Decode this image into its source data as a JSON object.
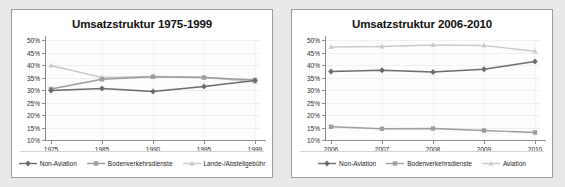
{
  "page": {
    "background_color": "#e8e8e8",
    "panel_background_color": "#ffffff",
    "panel_border_color": "#9a9a9a"
  },
  "colors": {
    "non_aviation": "#6b6b6b",
    "bodenverkehrsdienste": "#9d9d9d",
    "lande_abstellgebuehr": "#c9c9c9",
    "aviation": "#c9c9c9",
    "axis": "#8d8d8d",
    "grid": "#efefef",
    "text": "#1d1d1d"
  },
  "chart_data": [
    {
      "type": "line",
      "title": "Umsatzstruktur 1975-1999",
      "xlabel": "",
      "ylabel": "",
      "categories": [
        "1975",
        "1985",
        "1990",
        "1995",
        "1999"
      ],
      "ylim": [
        10,
        50
      ],
      "ytick_labels": [
        "50%",
        "45%",
        "40%",
        "35%",
        "30%",
        "25%",
        "20%",
        "15%",
        "10%"
      ],
      "ytick_values": [
        50,
        45,
        40,
        35,
        30,
        25,
        20,
        15,
        10
      ],
      "grid": true,
      "legend_position": "bottom",
      "series": [
        {
          "name": "Non-Aviation",
          "color": "#6b6b6b",
          "marker": "diamond",
          "values": [
            29.8,
            30.6,
            29.4,
            31.4,
            33.8
          ]
        },
        {
          "name": "Bodenverkehrsdienste",
          "color": "#9d9d9d",
          "marker": "square",
          "values": [
            30.4,
            34.3,
            35.3,
            35.0,
            34.0
          ]
        },
        {
          "name": "Lande-/Abstellgebühr",
          "color": "#c9c9c9",
          "marker": "triangle",
          "values": [
            39.8,
            35.0,
            35.4,
            35.1,
            33.2
          ]
        }
      ]
    },
    {
      "type": "line",
      "title": "Umsatzstruktur 2006-2010",
      "xlabel": "",
      "ylabel": "",
      "categories": [
        "2006",
        "2007",
        "2008",
        "2009",
        "2010"
      ],
      "ylim": [
        10,
        50
      ],
      "ytick_labels": [
        "50%",
        "45%",
        "40%",
        "35%",
        "30%",
        "25%",
        "20%",
        "15%",
        "10%"
      ],
      "ytick_values": [
        50,
        45,
        40,
        35,
        30,
        25,
        20,
        15,
        10
      ],
      "grid": true,
      "legend_position": "bottom",
      "series": [
        {
          "name": "Non-Aviation",
          "color": "#6b6b6b",
          "marker": "diamond",
          "values": [
            37.4,
            37.9,
            37.2,
            38.3,
            41.4
          ]
        },
        {
          "name": "Bodenverkehrsdienste",
          "color": "#9d9d9d",
          "marker": "square",
          "values": [
            15.3,
            14.5,
            14.6,
            13.8,
            13.0
          ]
        },
        {
          "name": "Aviation",
          "color": "#c9c9c9",
          "marker": "triangle",
          "values": [
            47.2,
            47.4,
            48.0,
            47.8,
            45.5
          ]
        }
      ]
    }
  ]
}
